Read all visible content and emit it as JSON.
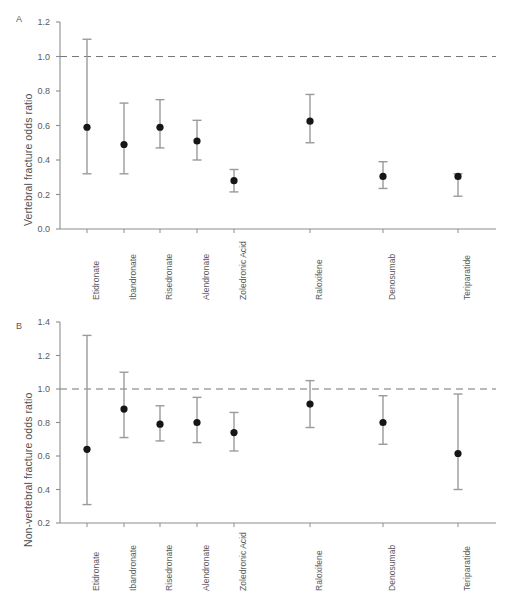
{
  "figure": {
    "panel_a_letter": "A",
    "panel_b_letter": "B"
  },
  "chart_data": [
    {
      "type": "scatter",
      "panel": "A",
      "title": "",
      "xlabel": "",
      "ylabel": "Vertebral fracture odds ratio",
      "ylim": [
        0.0,
        1.2
      ],
      "ytick_labels": [
        "0.0",
        "0.2",
        "0.4",
        "0.6",
        "0.8",
        "1.0",
        "1.2"
      ],
      "yticks": [
        0.0,
        0.2,
        0.4,
        0.6,
        0.8,
        1.0,
        1.2
      ],
      "grid": false,
      "legend": "none",
      "reference_line": 1.0,
      "reference_line_style": "dashed",
      "categories": [
        "Etidronate",
        "Ibandronate",
        "Risedronate",
        "Alendronate",
        "Zoledronic Acid",
        "Raloxifene",
        "Denosumab",
        "Teriparatide"
      ],
      "values": [
        0.59,
        0.49,
        0.59,
        0.51,
        0.28,
        0.625,
        0.305,
        0.305
      ],
      "ci_lower": [
        0.32,
        0.32,
        0.47,
        0.4,
        0.215,
        0.5,
        0.235,
        0.19
      ],
      "ci_upper": [
        1.1,
        0.73,
        0.75,
        0.63,
        0.345,
        0.78,
        0.39,
        0.32
      ]
    },
    {
      "type": "scatter",
      "panel": "B",
      "title": "",
      "xlabel": "",
      "ylabel": "Non-vertebral fracture odds ratio",
      "ylim": [
        0.2,
        1.4
      ],
      "ytick_labels": [
        "0.2",
        "0.4",
        "0.6",
        "0.8",
        "1.0",
        "1.2",
        "1.4"
      ],
      "yticks": [
        0.2,
        0.4,
        0.6,
        0.8,
        1.0,
        1.2,
        1.4
      ],
      "grid": false,
      "legend": "none",
      "reference_line": 1.0,
      "reference_line_style": "dashed",
      "categories": [
        "Etidronate",
        "Ibandronate",
        "Risedronate",
        "Alendronate",
        "Zoledronic Acid",
        "Raloxifene",
        "Denosumab",
        "Teriparatide"
      ],
      "values": [
        0.64,
        0.88,
        0.79,
        0.8,
        0.74,
        0.91,
        0.8,
        0.615
      ],
      "ci_lower": [
        0.31,
        0.71,
        0.69,
        0.68,
        0.63,
        0.77,
        0.67,
        0.4
      ],
      "ci_upper": [
        1.32,
        1.1,
        0.9,
        0.95,
        0.86,
        1.05,
        0.96,
        0.97
      ]
    }
  ],
  "colors": {
    "marker": "#161616",
    "errorbar": "#9a9a9c",
    "axis": "#8d8d8f",
    "reference": "#76767a",
    "text": "#5a5a5c"
  }
}
